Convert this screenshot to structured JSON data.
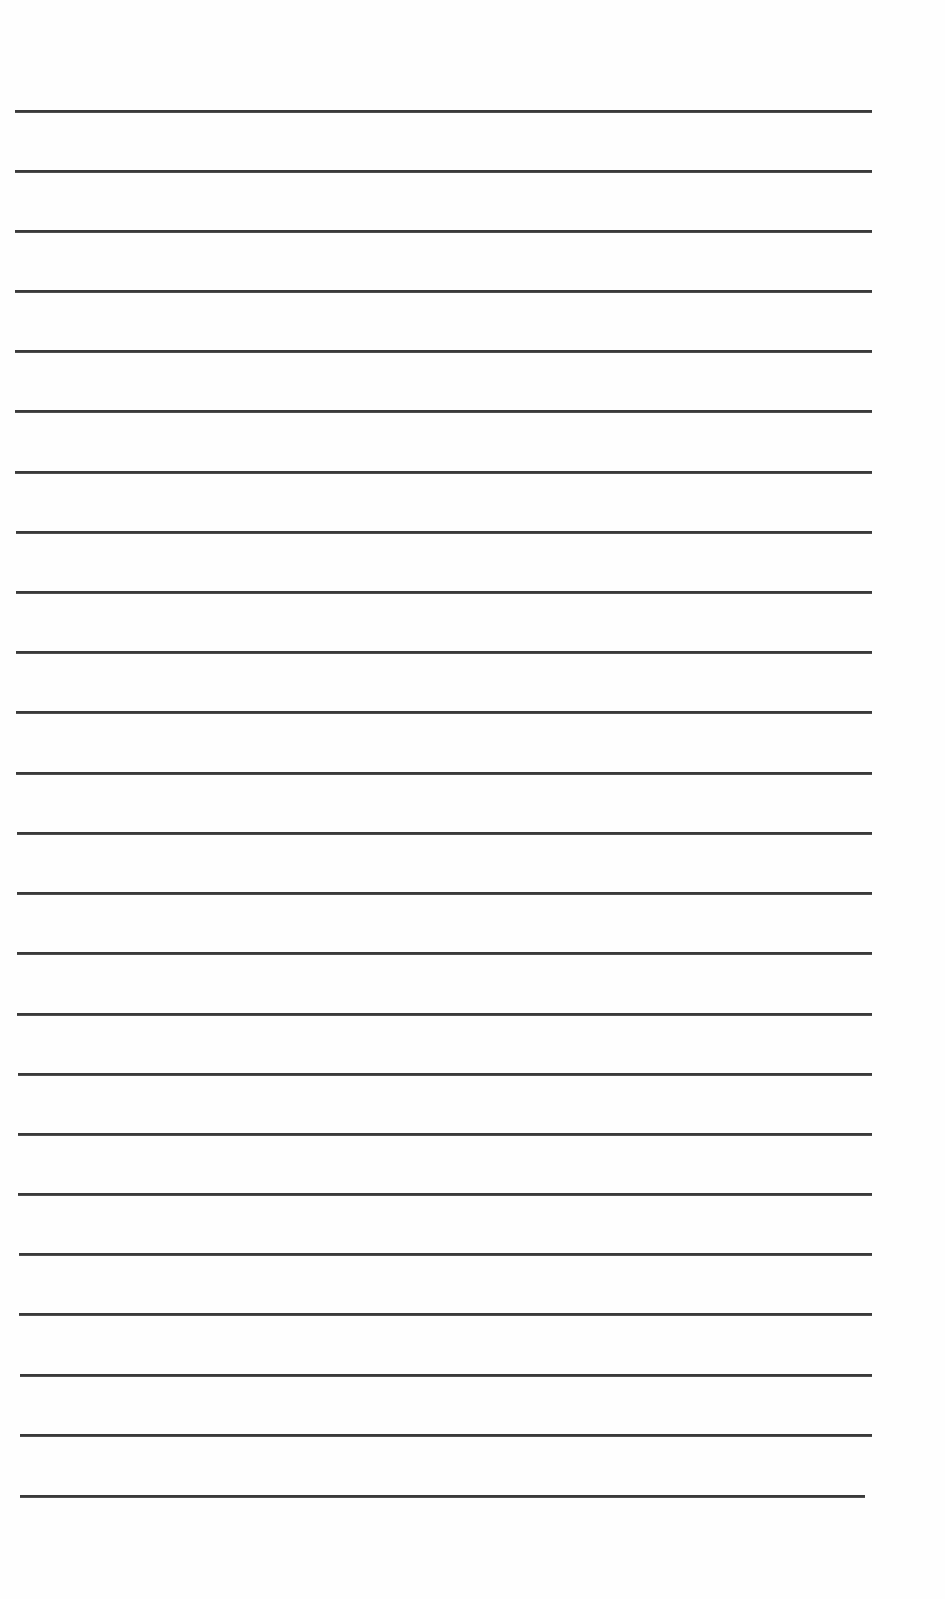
{
  "document": {
    "type": "lined-paper",
    "background_color": "#fefefe",
    "rule_color": "#3a3a3a",
    "rules": [
      {
        "y": 111,
        "x1": 15,
        "x2": 872
      },
      {
        "y": 171,
        "x1": 15,
        "x2": 872
      },
      {
        "y": 231,
        "x1": 15,
        "x2": 872
      },
      {
        "y": 291,
        "x1": 15,
        "x2": 872
      },
      {
        "y": 351,
        "x1": 15,
        "x2": 872
      },
      {
        "y": 411,
        "x1": 15,
        "x2": 872
      },
      {
        "y": 472,
        "x1": 15,
        "x2": 872
      },
      {
        "y": 532,
        "x1": 16,
        "x2": 872
      },
      {
        "y": 592,
        "x1": 16,
        "x2": 872
      },
      {
        "y": 652,
        "x1": 16,
        "x2": 872
      },
      {
        "y": 712,
        "x1": 16,
        "x2": 872
      },
      {
        "y": 773,
        "x1": 16,
        "x2": 872
      },
      {
        "y": 833,
        "x1": 17,
        "x2": 872
      },
      {
        "y": 893,
        "x1": 17,
        "x2": 872
      },
      {
        "y": 953,
        "x1": 17,
        "x2": 872
      },
      {
        "y": 1014,
        "x1": 17,
        "x2": 872
      },
      {
        "y": 1074,
        "x1": 18,
        "x2": 872
      },
      {
        "y": 1134,
        "x1": 18,
        "x2": 872
      },
      {
        "y": 1194,
        "x1": 18,
        "x2": 872
      },
      {
        "y": 1254,
        "x1": 19,
        "x2": 872
      },
      {
        "y": 1314,
        "x1": 19,
        "x2": 872
      },
      {
        "y": 1375,
        "x1": 20,
        "x2": 872
      },
      {
        "y": 1435,
        "x1": 20,
        "x2": 872
      },
      {
        "y": 1496,
        "x1": 20,
        "x2": 865
      }
    ]
  }
}
